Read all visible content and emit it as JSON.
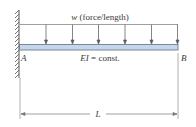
{
  "diagram": {
    "type": "cantilever-beam-uniform-load",
    "load_label": "w (force/length)",
    "load_label_var": "w",
    "load_label_unit": " (force/length)",
    "stiffness_label": "EI = const.",
    "stiffness_var": "EI",
    "stiffness_rest": " = const.",
    "left_end_label": "A",
    "right_end_label": "B",
    "length_label": "L",
    "support": "fixed-wall-left",
    "arrow_count": 6,
    "colors": {
      "beam_fill": "#c5d7e8",
      "beam_stroke": "#6b7f93",
      "line": "#7a7a7a",
      "text": "#3a3a3a"
    }
  }
}
